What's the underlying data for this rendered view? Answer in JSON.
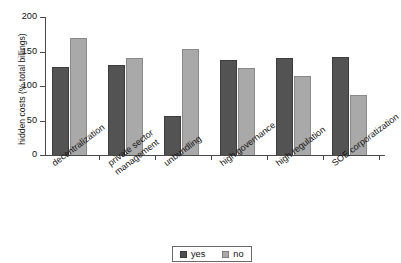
{
  "chart_data": {
    "type": "bar",
    "title": "",
    "xlabel": "",
    "ylabel": "hidden costs (% total billings)",
    "ylim": [
      0,
      200
    ],
    "yticks": [
      0,
      50,
      100,
      150,
      200
    ],
    "grid": false,
    "legend_position": "bottom",
    "categories": [
      "decentralization",
      "private sector management",
      "unbundling",
      "high governance",
      "high regulation",
      "SOE corporatization"
    ],
    "category_lines": [
      [
        "decentralization"
      ],
      [
        "private sector",
        "management"
      ],
      [
        "unbundling"
      ],
      [
        "high governance"
      ],
      [
        "high regulation"
      ],
      [
        "SOE corporatization"
      ]
    ],
    "series": [
      {
        "name": "yes",
        "color": "#535353",
        "values": [
          128,
          131,
          56,
          138,
          141,
          142
        ]
      },
      {
        "name": "no",
        "color": "#a9a9a9",
        "values": [
          170,
          141,
          153,
          126,
          115,
          87
        ]
      }
    ]
  },
  "legend": {
    "items": [
      {
        "label": "yes"
      },
      {
        "label": "no"
      }
    ]
  },
  "colors": {
    "series_yes": "#535353",
    "series_no": "#a9a9a9",
    "axis": "#4a4a4a",
    "text": "#111111",
    "background": "#ffffff"
  }
}
